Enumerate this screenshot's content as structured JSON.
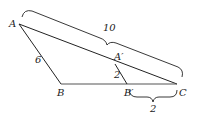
{
  "diagram": {
    "type": "similar-triangles",
    "points": {
      "A": {
        "label": "A",
        "x": 19,
        "y": 24
      },
      "B": {
        "label": "B",
        "x": 61,
        "y": 84
      },
      "C": {
        "label": "C",
        "x": 177,
        "y": 84
      },
      "A_prime": {
        "label": "A′",
        "x": 115,
        "y": 64
      },
      "B_prime": {
        "label": "B′",
        "x": 127,
        "y": 84
      }
    },
    "measurements": {
      "AB": "6",
      "AC": "10",
      "A_prime_B_prime": "2",
      "B_prime_C": "2"
    }
  }
}
